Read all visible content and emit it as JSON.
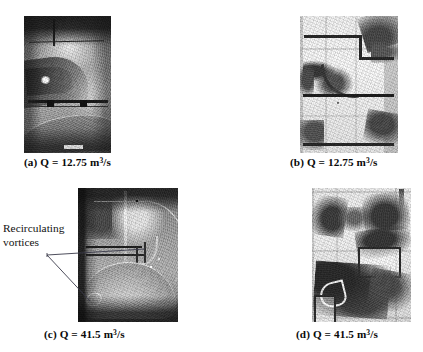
{
  "figure": {
    "background_color": "#ffffff",
    "text_color": "#0a0a0a",
    "panels": [
      {
        "id": "a",
        "caption": "(a) Q = 12.75 m3/s",
        "label": "(a)",
        "quantity_symbol": "Q",
        "equals": "=",
        "value": "12.75",
        "unit_base": "m",
        "unit_exponent": "3",
        "unit_denominator": "/s",
        "description": "side-view photograph of flow in model intake, low discharge"
      },
      {
        "id": "b",
        "caption": "(b) Q = 12.75 m3/s",
        "label": "(b)",
        "quantity_symbol": "Q",
        "equals": "=",
        "value": "12.75",
        "unit_base": "m",
        "unit_exponent": "3",
        "unit_denominator": "/s",
        "description": "plan/front-view photograph of flow in model intake, low discharge"
      },
      {
        "id": "c",
        "caption": "(c) Q = 41.5 m3/s",
        "label": "(c)",
        "quantity_symbol": "Q",
        "equals": "=",
        "value": "41.5",
        "unit_base": "m",
        "unit_exponent": "3",
        "unit_denominator": "/s",
        "description": "side-view photograph of flow in model intake, high discharge, with recirculating vortices"
      },
      {
        "id": "d",
        "caption": "(d) Q = 41.5 m3/s",
        "label": "(d)",
        "quantity_symbol": "Q",
        "equals": "=",
        "value": "41.5",
        "unit_base": "m",
        "unit_exponent": "3",
        "unit_denominator": "/s",
        "description": "plan/front-view photograph of flow in model intake, high discharge"
      }
    ],
    "annotation": {
      "line1": "Recirculating",
      "line2": "vortices",
      "leader_color": "#3a3a4a",
      "targets": 2
    }
  }
}
